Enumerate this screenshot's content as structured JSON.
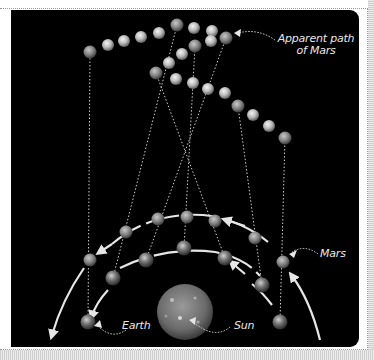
{
  "diagram": {
    "labels": {
      "apparent_path_line1": "Apparent path",
      "apparent_path_line2": "of Mars",
      "mars": "Mars",
      "earth": "Earth",
      "sun": "Sun"
    },
    "colors": {
      "background": "#000000",
      "line": "#d8d8d8",
      "arrow": "#e6e6e6",
      "text": "#e8e8e8"
    },
    "apparent_path": {
      "labeled_positions": [
        [
          90,
          52
        ],
        [
          177,
          25
        ],
        [
          226,
          38
        ],
        [
          195,
          46
        ],
        [
          156,
          73
        ],
        [
          238,
          106
        ],
        [
          285,
          138
        ]
      ],
      "intermediate_positions": [
        [
          108,
          45
        ],
        [
          124,
          41
        ],
        [
          141,
          37
        ],
        [
          159,
          33
        ],
        [
          194,
          28
        ],
        [
          212,
          31
        ],
        [
          211,
          41
        ],
        [
          182,
          54
        ],
        [
          169,
          63
        ],
        [
          176,
          79
        ],
        [
          193,
          83
        ],
        [
          208,
          89
        ],
        [
          225,
          93
        ],
        [
          253,
          115
        ],
        [
          269,
          126
        ]
      ]
    },
    "mars_orbit_positions": [
      [
        90,
        260
      ],
      [
        126,
        232
      ],
      [
        158,
        219
      ],
      [
        187,
        217
      ],
      [
        215,
        221
      ],
      [
        255,
        238
      ],
      [
        283,
        262
      ]
    ],
    "earth_orbit_positions": [
      [
        88,
        322
      ],
      [
        113,
        278
      ],
      [
        146,
        260
      ],
      [
        184,
        248
      ],
      [
        225,
        258
      ],
      [
        262,
        285
      ],
      [
        280,
        322
      ]
    ],
    "sun": {
      "center": [
        185,
        312
      ],
      "radius": 28
    }
  }
}
